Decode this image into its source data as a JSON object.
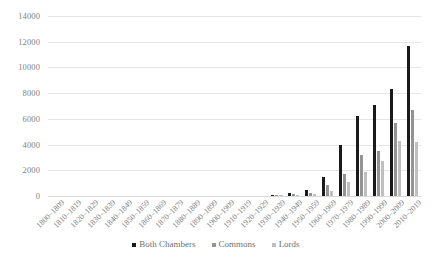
{
  "chart_data": {
    "type": "bar",
    "title": "",
    "subtitle": "",
    "xlabel": "",
    "ylabel": "",
    "ylim": [
      0,
      14000
    ],
    "ytick_step": 2000,
    "yticks": [
      "14000",
      "12000",
      "10000",
      "8000",
      "6000",
      "4000",
      "2000",
      "0"
    ],
    "grid": true,
    "legend_position": "bottom",
    "categories": [
      "1800–1809",
      "1810–1819",
      "1820–1829",
      "1830–1839",
      "1840–1849",
      "1850–1859",
      "1860–1869",
      "1870–1879",
      "1880–1889",
      "1890–1899",
      "1900–1909",
      "1910–1919",
      "1920–1929",
      "1930–1939",
      "1940–1949",
      "1950–1959",
      "1960–1969",
      "1970–1979",
      "1980–1989",
      "1990–1999",
      "2000–2009",
      "2010–2019"
    ],
    "series": [
      {
        "name": "Both Chambers",
        "color": "#1a1a1a",
        "values": [
          0,
          0,
          0,
          0,
          0,
          0,
          0,
          0,
          0,
          0,
          0,
          0,
          0,
          20,
          230,
          430,
          1450,
          4000,
          6200,
          7050,
          8300,
          11700
        ]
      },
      {
        "name": "Commons",
        "color": "#949494",
        "values": [
          0,
          0,
          0,
          0,
          0,
          0,
          0,
          0,
          0,
          0,
          0,
          0,
          0,
          10,
          120,
          250,
          880,
          1700,
          3200,
          3500,
          5700,
          6700
        ]
      },
      {
        "name": "Lords",
        "color": "#bfbfbf",
        "values": [
          0,
          0,
          0,
          0,
          0,
          0,
          0,
          0,
          0,
          0,
          0,
          0,
          0,
          5,
          60,
          150,
          420,
          1100,
          1900,
          2700,
          4300,
          4200
        ]
      }
    ]
  }
}
